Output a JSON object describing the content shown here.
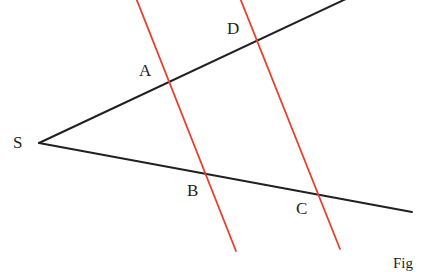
{
  "figure": {
    "width": 425,
    "height": 272,
    "background_color": "#ffffff",
    "caption": "Fig",
    "caption_position": {
      "x": 393,
      "y": 256
    },
    "colors": {
      "ray_color": "#231f20",
      "transversal_color": "#e8402a",
      "label_color": "#231f20"
    },
    "stroke_widths": {
      "ray": 2.0,
      "transversal": 1.8
    },
    "vertex": {
      "name": "S",
      "x": 39,
      "y": 143
    },
    "rays": [
      {
        "name": "upper-ray",
        "from": {
          "x": 39,
          "y": 143
        },
        "to": {
          "x": 348,
          "y": -2
        },
        "color": "#231f20"
      },
      {
        "name": "lower-ray",
        "from": {
          "x": 39,
          "y": 143
        },
        "to": {
          "x": 412,
          "y": 212
        },
        "color": "#231f20"
      }
    ],
    "transversals": [
      {
        "name": "transversal-AB",
        "from": {
          "x": 136,
          "y": -2
        },
        "to": {
          "x": 236,
          "y": 251
        },
        "color": "#e8402a"
      },
      {
        "name": "transversal-DC",
        "from": {
          "x": 240,
          "y": -2
        },
        "to": {
          "x": 340,
          "y": 249
        },
        "color": "#e8402a"
      }
    ],
    "points": [
      {
        "id": "S",
        "label": "S",
        "x": 39,
        "y": 143,
        "label_x": 13,
        "label_y": 134,
        "on": "vertex"
      },
      {
        "id": "A",
        "label": "A",
        "x": 167,
        "y": 82,
        "label_x": 139,
        "label_y": 62,
        "on": "upper-ray × transversal-AB"
      },
      {
        "id": "D",
        "label": "D",
        "x": 255,
        "y": 41,
        "label_x": 227,
        "label_y": 20,
        "on": "upper-ray × transversal-DC"
      },
      {
        "id": "B",
        "label": "B",
        "x": 206,
        "y": 175,
        "label_x": 187,
        "label_y": 182,
        "on": "lower-ray × transversal-AB"
      },
      {
        "id": "C",
        "label": "C",
        "x": 314,
        "y": 192,
        "label_x": 296,
        "label_y": 200,
        "on": "lower-ray × transversal-DC"
      }
    ]
  }
}
